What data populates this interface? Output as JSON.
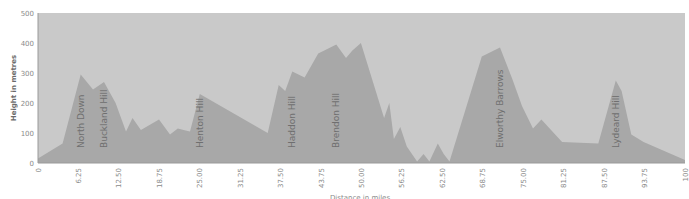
{
  "chart_data": {
    "type": "area",
    "title": "",
    "xlabel": "Distance in miles",
    "ylabel": "Height in metres",
    "xlim": [
      0,
      100
    ],
    "ylim": [
      0,
      500
    ],
    "x_ticks": [
      "0",
      "6.25",
      "12.50",
      "18.75",
      "25.00",
      "31.25",
      "37.50",
      "43.75",
      "50.00",
      "56.25",
      "62.50",
      "68.75",
      "75.00",
      "81.25",
      "87.50",
      "93.75",
      "100"
    ],
    "y_ticks": [
      "0",
      "100",
      "200",
      "300",
      "400",
      "500"
    ],
    "grid": false,
    "legend": "none",
    "colors": {
      "plot_bg": "#c9c9c9",
      "area": "#a8a8a8",
      "axis": "#9a9a9a",
      "text": "#6f6f6f"
    },
    "series": [
      {
        "name": "Elevation",
        "x": [
          0,
          3.8,
          6.6,
          8.5,
          10.2,
          12.0,
          13.6,
          14.6,
          15.9,
          18.7,
          20.4,
          21.6,
          22.5,
          23.5,
          25.0,
          35.5,
          37.2,
          38.2,
          39.3,
          41.2,
          43.3,
          46.1,
          47.6,
          48.6,
          49.9,
          53.5,
          54.3,
          55.0,
          56.0,
          57.0,
          58.6,
          59.6,
          60.5,
          61.8,
          62.7,
          63.6,
          68.6,
          70.0,
          71.4,
          73.3,
          74.8,
          76.5,
          77.8,
          81.0,
          86.6,
          89.3,
          90.2,
          91.7,
          93.6,
          100
        ],
        "y": [
          15,
          65,
          295,
          245,
          270,
          200,
          105,
          150,
          110,
          145,
          95,
          115,
          110,
          105,
          230,
          100,
          260,
          240,
          305,
          285,
          365,
          395,
          350,
          375,
          400,
          150,
          200,
          80,
          120,
          55,
          5,
          30,
          5,
          65,
          30,
          5,
          355,
          370,
          385,
          280,
          190,
          115,
          145,
          70,
          65,
          275,
          240,
          95,
          70,
          10
        ]
      }
    ],
    "annotations": [
      {
        "label": "North Down",
        "x": 6.6
      },
      {
        "label": "Buckland Hill",
        "x": 10.2
      },
      {
        "label": "Henton Hill",
        "x": 25.0
      },
      {
        "label": "Haddon Hill",
        "x": 39.3
      },
      {
        "label": "Brendon Hill",
        "x": 46.1
      },
      {
        "label": "Elworthy Barrows",
        "x": 71.4
      },
      {
        "label": "Lydeard Hill",
        "x": 89.3
      }
    ]
  }
}
